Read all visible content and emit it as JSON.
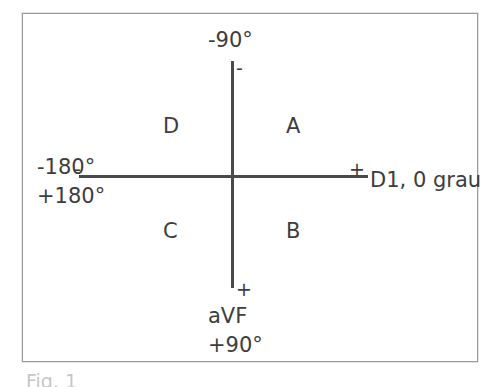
{
  "figure": {
    "caption": "Fig. 1",
    "axes": {
      "vertical_name": "vertical-axis",
      "horizontal_name": "horizontal-axis"
    },
    "labels": {
      "top_degree": "-90°",
      "left_degree_negative": "-180°",
      "left_degree_positive": "+180°",
      "right_lead": "D1, 0 grau",
      "bottom_lead": "aVF",
      "bottom_degree": "+90°"
    },
    "signs": {
      "top": "-",
      "bottom": "+",
      "left": "-",
      "right": "+"
    },
    "quadrants": [
      {
        "id": "A",
        "label": "A",
        "position": "upper-right"
      },
      {
        "id": "B",
        "label": "B",
        "position": "lower-right"
      },
      {
        "id": "C",
        "label": "C",
        "position": "lower-left"
      },
      {
        "id": "D",
        "label": "D",
        "position": "upper-left"
      }
    ],
    "colors": {
      "stroke": "#4a4a4a",
      "text": "#3d3d3d",
      "frame": "#9a9a9a",
      "background": "#ffffff"
    }
  }
}
